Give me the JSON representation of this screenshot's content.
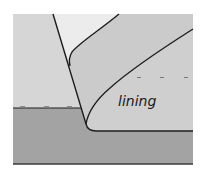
{
  "diagram": {
    "type": "cross-section",
    "labels": [
      {
        "id": "lining",
        "text": "lining",
        "x": 118,
        "y": 94
      }
    ],
    "colors": {
      "background": "#ffffff",
      "left_region": "#d6d6d6",
      "top_wedge": "#ececec",
      "lining_region": "#cbcbcb",
      "base_region": "#a3a3a3",
      "line": "#1e1e1e"
    },
    "markers": {
      "left_ticks_y": 108,
      "left_ticks_x": [
        22,
        46,
        69
      ],
      "right_dashes_y": 77,
      "right_dashes_x": [
        139,
        162,
        186
      ]
    }
  }
}
